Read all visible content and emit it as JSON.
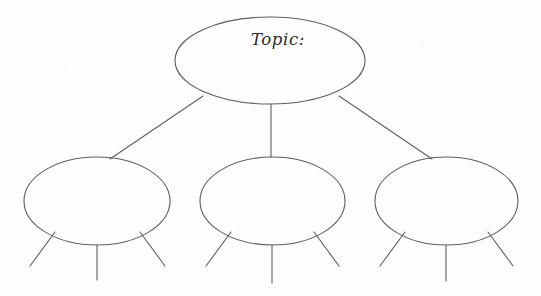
{
  "document": {
    "kind": "graphic-organizer",
    "layout": "topic-with-three-branches",
    "background_color": "#fdfdfd",
    "stroke_color": "#5f5f5f",
    "stroke_width": 1.1,
    "ink_color": "#2a2a2a",
    "width": 541,
    "height": 296
  },
  "topic_node": {
    "label": "Topic:",
    "label_x": 251,
    "label_y": 45,
    "cx": 270,
    "cy": 60.5,
    "rx": 95,
    "ry": 43.5
  },
  "branch_nodes": [
    {
      "name": "branch-node-left",
      "label": "",
      "cx": 97,
      "cy": 201,
      "rx": 73,
      "ry": 44
    },
    {
      "name": "branch-node-middle",
      "label": "",
      "cx": 272.5,
      "cy": 201,
      "rx": 72.5,
      "ry": 44
    },
    {
      "name": "branch-node-right",
      "label": "",
      "cx": 446.5,
      "cy": 201,
      "rx": 71.5,
      "ry": 44
    }
  ],
  "connectors": [
    {
      "name": "connector-topic-to-left",
      "x1": 203,
      "y1": 96,
      "x2": 110,
      "y2": 159
    },
    {
      "name": "connector-topic-to-middle",
      "x1": 271,
      "y1": 104,
      "x2": 271,
      "y2": 157
    },
    {
      "name": "connector-topic-to-right",
      "x1": 339,
      "y1": 96,
      "x2": 432,
      "y2": 159
    }
  ],
  "detail_legs": [
    {
      "name": "leg-left-node-1",
      "x1": 55,
      "y1": 232,
      "x2": 30,
      "y2": 266
    },
    {
      "name": "leg-left-node-2",
      "x1": 97,
      "y1": 245,
      "x2": 97,
      "y2": 280
    },
    {
      "name": "leg-left-node-3",
      "x1": 140,
      "y1": 232,
      "x2": 165,
      "y2": 266
    },
    {
      "name": "leg-middle-node-1",
      "x1": 231,
      "y1": 232,
      "x2": 206,
      "y2": 266
    },
    {
      "name": "leg-middle-node-2",
      "x1": 272,
      "y1": 245,
      "x2": 272,
      "y2": 283
    },
    {
      "name": "leg-middle-node-3",
      "x1": 314,
      "y1": 232,
      "x2": 339,
      "y2": 266
    },
    {
      "name": "leg-right-node-1",
      "x1": 405,
      "y1": 232,
      "x2": 380,
      "y2": 266
    },
    {
      "name": "leg-right-node-2",
      "x1": 446,
      "y1": 245,
      "x2": 446,
      "y2": 281
    },
    {
      "name": "leg-right-node-3",
      "x1": 488,
      "y1": 232,
      "x2": 513,
      "y2": 266
    }
  ]
}
